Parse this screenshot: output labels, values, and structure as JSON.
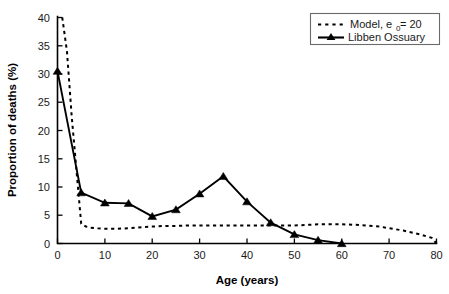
{
  "chart_data": {
    "type": "line",
    "title": "",
    "xlabel": "Age (years)",
    "ylabel": "Proportion of deaths (%)",
    "xlim": [
      0,
      80
    ],
    "ylim": [
      0,
      40
    ],
    "xticks": [
      0,
      10,
      20,
      30,
      40,
      50,
      60,
      70,
      80
    ],
    "yticks": [
      0,
      5,
      10,
      15,
      20,
      25,
      30,
      35,
      40
    ],
    "grid": false,
    "legend_position": "top-right",
    "series": [
      {
        "name": "Model, e0 = 20",
        "legend_label_main": "Model, e",
        "legend_label_sub": "0",
        "legend_label_tail": " = 20",
        "style": "dashed",
        "marker": "none",
        "color": "#000000",
        "x": [
          1,
          2,
          3,
          4,
          5,
          6,
          7,
          8,
          10,
          12,
          15,
          18,
          20,
          22,
          25,
          28,
          30,
          33,
          35,
          38,
          40,
          43,
          45,
          48,
          50,
          53,
          55,
          58,
          60,
          63,
          65,
          68,
          70,
          73,
          75,
          77,
          79,
          80
        ],
        "y": [
          40.0,
          34.0,
          22.5,
          13.0,
          3.5,
          3.0,
          2.8,
          2.7,
          2.6,
          2.6,
          2.7,
          2.9,
          3.0,
          3.1,
          3.1,
          3.2,
          3.2,
          3.2,
          3.2,
          3.2,
          3.2,
          3.2,
          3.2,
          3.2,
          3.2,
          3.3,
          3.4,
          3.4,
          3.4,
          3.3,
          3.2,
          3.0,
          2.7,
          2.3,
          1.9,
          1.5,
          1.0,
          0.0
        ]
      },
      {
        "name": "Libben Ossuary",
        "legend_label_main": "Libben Ossuary",
        "style": "solid",
        "marker": "triangle",
        "color": "#000000",
        "x": [
          0,
          5,
          10,
          15,
          20,
          25,
          30,
          35,
          40,
          45,
          50,
          55,
          60
        ],
        "y": [
          30.5,
          9.0,
          7.2,
          7.1,
          4.8,
          6.0,
          8.8,
          11.9,
          7.4,
          3.7,
          1.6,
          0.6,
          0.0
        ]
      }
    ]
  },
  "axes": {
    "x_title": "Age (years)",
    "y_title": "Proportion of deaths (%)",
    "x_tick_labels": [
      "0",
      "10",
      "20",
      "30",
      "40",
      "50",
      "60",
      "70",
      "80"
    ],
    "y_tick_labels": [
      "0",
      "5",
      "10",
      "15",
      "20",
      "25",
      "30",
      "35",
      "40"
    ]
  },
  "legend": {
    "entries": [
      {
        "label": "Model, e0 = 20",
        "text_main": "Model, e",
        "text_sub": "0",
        "text_tail": " = 20",
        "style": "dashed"
      },
      {
        "label": "Libben Ossuary",
        "text_main": "Libben Ossuary",
        "style": "solid-marker"
      }
    ]
  },
  "colors": {
    "line": "#000000",
    "axis": "#000000",
    "text": "#1a1a1a",
    "legend_border": "#6b6b6b",
    "background": "#ffffff"
  }
}
